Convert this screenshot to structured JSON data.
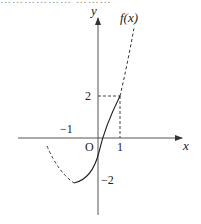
{
  "header": {
    "clipped_text": "……………… ………"
  },
  "axes": {
    "x_label": "x",
    "y_label": "y",
    "origin_label": "O",
    "ticks": {
      "x_pos_1": "1",
      "x_neg_1": "−1",
      "y_pos_2": "2",
      "y_neg_2": "−2"
    }
  },
  "curve": {
    "label": "f(x)",
    "color": "#333333",
    "key_point": {
      "x": 1,
      "y": 2
    },
    "segments": [
      {
        "style": "dashed",
        "from_x": -1.7,
        "to_x": -0.7
      },
      {
        "style": "solid",
        "from_x": -0.7,
        "to_x": 1
      },
      {
        "style": "dashed",
        "from_x": 1,
        "to_x": 1.6
      }
    ]
  },
  "guides": {
    "horizontal_dashed_at_y": 2,
    "vertical_dashed_at_x": 1
  }
}
